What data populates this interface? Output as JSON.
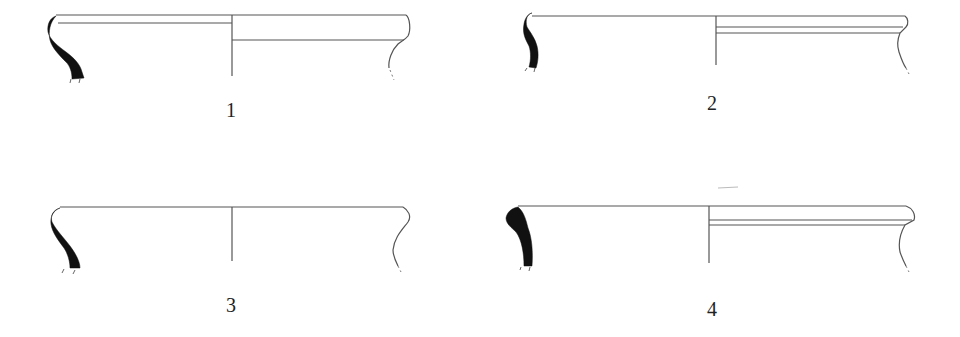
{
  "plate": {
    "description": "Pottery rim profile drawings (sections)",
    "background": "#ffffff",
    "ink_color": "#111111",
    "line_color": "#555555"
  },
  "figures": [
    {
      "number": "1",
      "label_pos": [
        226,
        103
      ]
    },
    {
      "number": "2",
      "label_pos": [
        707,
        96
      ]
    },
    {
      "number": "3",
      "label_pos": [
        226,
        298
      ]
    },
    {
      "number": "4",
      "label_pos": [
        707,
        302
      ]
    }
  ]
}
